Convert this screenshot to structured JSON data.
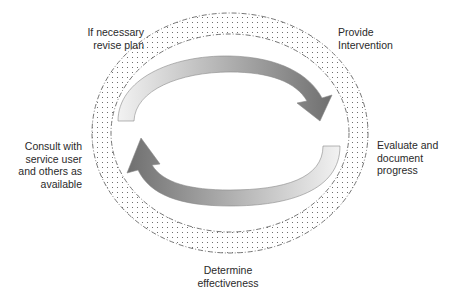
{
  "diagram": {
    "type": "cycle",
    "labels": {
      "top_left": {
        "lines": [
          "If necessary",
          "revise plan"
        ]
      },
      "top_right": {
        "lines": [
          "Provide",
          "Intervention"
        ]
      },
      "right": {
        "lines": [
          "Evaluate and",
          "document",
          "progress"
        ]
      },
      "bottom": {
        "lines": [
          "Determine",
          "effectiveness"
        ]
      },
      "left": {
        "lines": [
          "Consult with",
          "service user",
          "and others as",
          "available"
        ]
      }
    },
    "colors": {
      "arrow_dark": "#7a7a7a",
      "arrow_light": "#e6e6e6",
      "ring_border": "#666666",
      "ring_dots": "#555555"
    }
  }
}
